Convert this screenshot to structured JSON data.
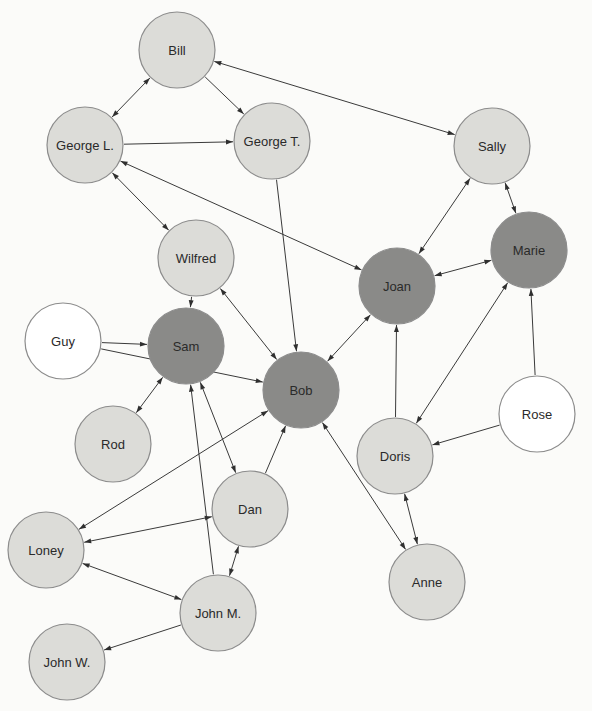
{
  "diagram": {
    "type": "sociogram",
    "colors": {
      "background": "#fbfbf9",
      "light_node": "#dcdcd8",
      "dark_node": "#8a8a88",
      "white_node": "#ffffff",
      "stroke": "#8c8c8c",
      "edge": "#3a3a3a"
    },
    "node_radius": 38,
    "nodes": [
      {
        "id": "bill",
        "label": "Bill",
        "x": 177,
        "y": 50,
        "shade": "light"
      },
      {
        "id": "george-l",
        "label": "George L.",
        "x": 85,
        "y": 145,
        "shade": "light"
      },
      {
        "id": "george-t",
        "label": "George T.",
        "x": 272,
        "y": 141,
        "shade": "light"
      },
      {
        "id": "sally",
        "label": "Sally",
        "x": 492,
        "y": 146,
        "shade": "light"
      },
      {
        "id": "wilfred",
        "label": "Wilfred",
        "x": 196,
        "y": 258,
        "shade": "light"
      },
      {
        "id": "joan",
        "label": "Joan",
        "x": 397,
        "y": 286,
        "shade": "dark"
      },
      {
        "id": "marie",
        "label": "Marie",
        "x": 529,
        "y": 250,
        "shade": "dark"
      },
      {
        "id": "guy",
        "label": "Guy",
        "x": 63,
        "y": 341,
        "shade": "white"
      },
      {
        "id": "sam",
        "label": "Sam",
        "x": 186,
        "y": 346,
        "shade": "dark"
      },
      {
        "id": "bob",
        "label": "Bob",
        "x": 301,
        "y": 390,
        "shade": "dark"
      },
      {
        "id": "rose",
        "label": "Rose",
        "x": 537,
        "y": 414,
        "shade": "white"
      },
      {
        "id": "doris",
        "label": "Doris",
        "x": 395,
        "y": 456,
        "shade": "light"
      },
      {
        "id": "rod",
        "label": "Rod",
        "x": 113,
        "y": 444,
        "shade": "light"
      },
      {
        "id": "dan",
        "label": "Dan",
        "x": 250,
        "y": 509,
        "shade": "light"
      },
      {
        "id": "loney",
        "label": "Loney",
        "x": 46,
        "y": 550,
        "shade": "light"
      },
      {
        "id": "anne",
        "label": "Anne",
        "x": 427,
        "y": 582,
        "shade": "light"
      },
      {
        "id": "john-m",
        "label": "John M.",
        "x": 218,
        "y": 613,
        "shade": "light"
      },
      {
        "id": "john-w",
        "label": "John W.",
        "x": 67,
        "y": 662,
        "shade": "light"
      }
    ],
    "edges": [
      {
        "from": "bill",
        "to": "george-l",
        "bidirectional": true
      },
      {
        "from": "bill",
        "to": "george-t",
        "bidirectional": false
      },
      {
        "from": "bill",
        "to": "sally",
        "bidirectional": true
      },
      {
        "from": "george-l",
        "to": "george-t",
        "bidirectional": false
      },
      {
        "from": "george-l",
        "to": "wilfred",
        "bidirectional": true
      },
      {
        "from": "george-l",
        "to": "joan",
        "bidirectional": true
      },
      {
        "from": "george-t",
        "to": "bob",
        "bidirectional": false
      },
      {
        "from": "sally",
        "to": "joan",
        "bidirectional": true
      },
      {
        "from": "sally",
        "to": "marie",
        "bidirectional": true
      },
      {
        "from": "joan",
        "to": "marie",
        "bidirectional": true
      },
      {
        "from": "wilfred",
        "to": "sam",
        "bidirectional": false
      },
      {
        "from": "wilfred",
        "to": "bob",
        "bidirectional": true
      },
      {
        "from": "guy",
        "to": "sam",
        "bidirectional": false
      },
      {
        "from": "guy",
        "to": "bob",
        "bidirectional": false
      },
      {
        "from": "sam",
        "to": "rod",
        "bidirectional": true
      },
      {
        "from": "sam",
        "to": "dan",
        "bidirectional": true
      },
      {
        "from": "john-m",
        "to": "sam",
        "bidirectional": false
      },
      {
        "from": "joan",
        "to": "bob",
        "bidirectional": true
      },
      {
        "from": "doris",
        "to": "joan",
        "bidirectional": false
      },
      {
        "from": "marie",
        "to": "doris",
        "bidirectional": true
      },
      {
        "from": "rose",
        "to": "marie",
        "bidirectional": false
      },
      {
        "from": "rose",
        "to": "doris",
        "bidirectional": false
      },
      {
        "from": "bob",
        "to": "anne",
        "bidirectional": true
      },
      {
        "from": "dan",
        "to": "bob",
        "bidirectional": false
      },
      {
        "from": "loney",
        "to": "bob",
        "bidirectional": true
      },
      {
        "from": "loney",
        "to": "dan",
        "bidirectional": true
      },
      {
        "from": "loney",
        "to": "john-m",
        "bidirectional": true
      },
      {
        "from": "dan",
        "to": "john-m",
        "bidirectional": true
      },
      {
        "from": "doris",
        "to": "anne",
        "bidirectional": true
      },
      {
        "from": "john-m",
        "to": "john-w",
        "bidirectional": false
      }
    ]
  }
}
